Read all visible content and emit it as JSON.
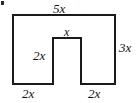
{
  "figure": {
    "type": "u-shaped-polygon",
    "stroke_color": "#1a1a1a",
    "fill_color": "#ffffff",
    "background_color": "#ffffff",
    "stroke_width": 2,
    "outline_points": "13,15 115,15 115,84 81,84 81,38 53,38 53,84 13,84",
    "labels": {
      "top": "5x",
      "right": "3x",
      "notch_top": "x",
      "notch_left": "2x",
      "bottom_left": "2x",
      "bottom_right": "2x"
    }
  },
  "chart_data": {
    "type": "diagram",
    "title": "",
    "shape": "U-shaped polygon (rectangle with bottom-center rectangular notch)",
    "dimensions": [
      {
        "edge": "top",
        "label": "5x",
        "value": 5,
        "variable": "x"
      },
      {
        "edge": "right",
        "label": "3x",
        "value": 3,
        "variable": "x"
      },
      {
        "edge": "notch-top",
        "label": "x",
        "value": 1,
        "variable": "x"
      },
      {
        "edge": "notch-left-vertical",
        "label": "2x",
        "value": 2,
        "variable": "x"
      },
      {
        "edge": "bottom-left",
        "label": "2x",
        "value": 2,
        "variable": "x"
      },
      {
        "edge": "bottom-right",
        "label": "2x",
        "value": 2,
        "variable": "x"
      }
    ]
  }
}
